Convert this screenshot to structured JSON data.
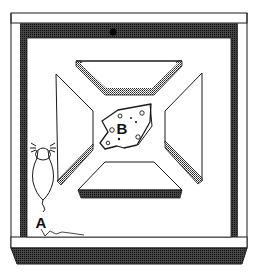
{
  "diagram": {
    "labels": {
      "start": "A",
      "goal": "B"
    },
    "elements": {
      "mouse": "mouse (start position A)",
      "cheese": "cheese (goal B)",
      "walls": [
        "top wall",
        "left wall",
        "right wall",
        "bottom wall"
      ],
      "barriers": [
        "top trapezoid barrier",
        "left trapezoid barrier",
        "right trapezoid barrier",
        "bottom trapezoid barrier"
      ]
    },
    "colors": {
      "line": "#1a1a1a",
      "hatch": "#3a3a3a",
      "background": "#ffffff"
    }
  }
}
